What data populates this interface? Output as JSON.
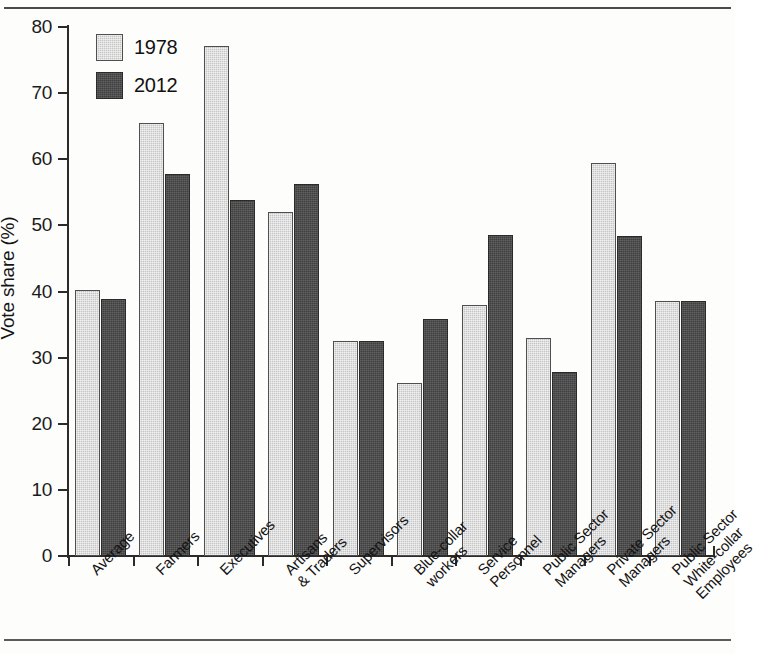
{
  "chart_data": {
    "type": "bar",
    "title": "",
    "xlabel": "",
    "ylabel": "Vote share (%)",
    "ylim": [
      0,
      80
    ],
    "yticks": [
      0,
      10,
      20,
      30,
      40,
      50,
      60,
      70,
      80
    ],
    "grid": false,
    "legend_position": "top-left",
    "categories": [
      "Average",
      "Farmers",
      "Executives",
      "Artisans & Traders",
      "Supervisors",
      "Blue-collar workers",
      "Service Personnel",
      "Public Sector Managers",
      "Private Sector Managers",
      "Public Sector White-collar Employees"
    ],
    "category_lines": [
      [
        "Average"
      ],
      [
        "Farmers"
      ],
      [
        "Executives"
      ],
      [
        "Artisans",
        "& Traders"
      ],
      [
        "Supervisors"
      ],
      [
        "Blue-collar",
        "workers"
      ],
      [
        "Service",
        "Personnel"
      ],
      [
        "Public Sector",
        "Managers"
      ],
      [
        "Private Sector",
        "Managers"
      ],
      [
        "Public Sector",
        "White-collar",
        "Employees"
      ]
    ],
    "series": [
      {
        "name": "1978",
        "color": "#c5c5c5",
        "values": [
          40.2,
          65.5,
          77.2,
          52.0,
          32.5,
          26.2,
          37.9,
          32.9,
          59.5,
          38.6
        ]
      },
      {
        "name": "2012",
        "color": "#3f3f3f",
        "values": [
          38.8,
          57.7,
          53.9,
          56.3,
          32.5,
          35.8,
          48.5,
          27.9,
          48.4,
          38.5
        ]
      }
    ]
  },
  "axis": {
    "y_title": "Vote share (%)",
    "y_tick_labels": [
      "0",
      "10",
      "20",
      "30",
      "40",
      "50",
      "60",
      "70",
      "80"
    ]
  },
  "legend": {
    "entries": [
      {
        "label": "1978",
        "series": "s1978"
      },
      {
        "label": "2012",
        "series": "s2012"
      }
    ]
  }
}
